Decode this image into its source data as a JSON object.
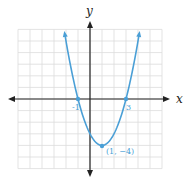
{
  "chart_data": {
    "type": "line",
    "title": "",
    "xlabel": "x",
    "ylabel": "y",
    "xlim": [
      -6,
      6
    ],
    "ylim": [
      -6,
      6
    ],
    "grid": true,
    "legend": null,
    "function": "y = x^2 - 2x - 3",
    "series": [
      {
        "name": "parabola",
        "color": "#4a9fd6",
        "x": [
          -2.1,
          -1.5,
          -1,
          -0.5,
          0,
          0.5,
          1,
          1.5,
          2,
          2.5,
          3,
          3.5,
          4.1
        ],
        "y": [
          4.61,
          2.25,
          0,
          -1.75,
          -3,
          -3.75,
          -4,
          -3.75,
          -3,
          -1.75,
          0,
          2.25,
          4.61
        ]
      }
    ],
    "annotations": [
      {
        "text": "-1",
        "x": -1,
        "y": 0
      },
      {
        "text": "3",
        "x": 3,
        "y": 0
      },
      {
        "text": "(1, −4)",
        "x": 1,
        "y": -4
      }
    ],
    "marked_points": [
      {
        "x": -1,
        "y": 0
      },
      {
        "x": 3,
        "y": 0
      },
      {
        "x": 1,
        "y": -4
      }
    ]
  },
  "labels": {
    "x_axis": "x",
    "y_axis": "y",
    "x_intercept_left": "-1",
    "x_intercept_right": "3",
    "vertex": "(1, −4)"
  },
  "colors": {
    "curve": "#4a9fd6",
    "axis": "#222222",
    "grid": "#d9d9d9"
  }
}
